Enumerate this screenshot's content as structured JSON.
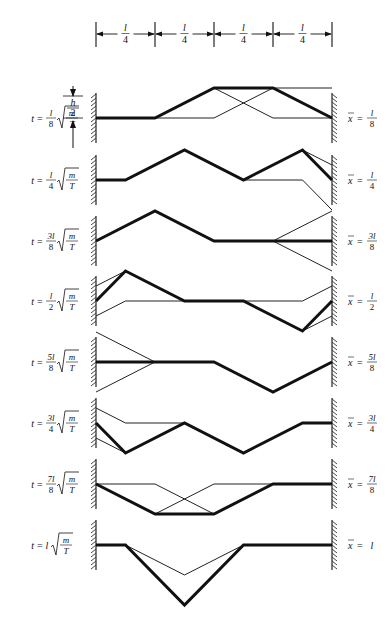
{
  "diagram": {
    "ruler": {
      "segments": [
        "l/4",
        "l/4",
        "l/4",
        "l/4"
      ],
      "numerator": "l",
      "denominator": "4",
      "ticks_x": [
        96,
        155,
        214,
        273,
        332
      ]
    },
    "amplitude_label": {
      "numerator": "h",
      "denominator": "2"
    },
    "string": {
      "left_x": 96,
      "right_x": 332,
      "amplitude_px": 30
    },
    "rows": [
      {
        "id": "t1",
        "time": {
          "prefix": "t =",
          "coef_num": "l",
          "coef_den": "8",
          "rad_num": "m",
          "rad_den": "T"
        },
        "xbar": {
          "prefix": "x̄ =",
          "num": "l",
          "den": "8"
        },
        "baseline_y": 118,
        "thick": [
          [
            0,
            0
          ],
          [
            0.25,
            0
          ],
          [
            0.5,
            1
          ],
          [
            0.75,
            1
          ],
          [
            1,
            0
          ]
        ],
        "thin": [
          [
            [
              0,
              0
            ],
            [
              0.5,
              0
            ],
            [
              0.75,
              1
            ],
            [
              1,
              1
            ]
          ],
          [
            [
              0.25,
              0
            ],
            [
              0.5,
              1
            ]
          ],
          [
            [
              0.5,
              1
            ],
            [
              0.75,
              0
            ],
            [
              1,
              0
            ]
          ]
        ]
      },
      {
        "id": "t2",
        "time": {
          "prefix": "t =",
          "coef_num": "l",
          "coef_den": "4",
          "rad_num": "m",
          "rad_den": "T"
        },
        "xbar": {
          "prefix": "x̄ =",
          "num": "l",
          "den": "4"
        },
        "baseline_y": 180,
        "thick": [
          [
            0,
            0
          ],
          [
            0.125,
            0
          ],
          [
            0.375,
            1
          ],
          [
            0.625,
            0
          ],
          [
            0.875,
            1
          ],
          [
            1,
            0
          ]
        ],
        "thin": [
          [
            [
              0.625,
              0
            ],
            [
              0.875,
              0
            ],
            [
              1,
              -1
            ]
          ],
          [
            [
              0.875,
              1
            ],
            [
              1,
              0.5
            ]
          ]
        ]
      },
      {
        "id": "t3",
        "time": {
          "prefix": "t =",
          "coef_num": "3l",
          "coef_den": "8",
          "rad_num": "m",
          "rad_den": "T"
        },
        "xbar": {
          "prefix": "x̄ =",
          "num": "3l",
          "den": "8"
        },
        "baseline_y": 241,
        "thick": [
          [
            0,
            0
          ],
          [
            0.25,
            1
          ],
          [
            0.5,
            0
          ],
          [
            1,
            0
          ]
        ],
        "thin": [
          [
            [
              0.75,
              0
            ],
            [
              1,
              1
            ]
          ],
          [
            [
              0.75,
              0
            ],
            [
              1,
              -1
            ]
          ]
        ]
      },
      {
        "id": "t4",
        "time": {
          "prefix": "t =",
          "coef_num": "l",
          "coef_den": "2",
          "rad_num": "m",
          "rad_den": "T"
        },
        "xbar": {
          "prefix": "x̄ =",
          "num": "l",
          "den": "2"
        },
        "baseline_y": 301,
        "thick": [
          [
            0,
            0
          ],
          [
            0.125,
            1
          ],
          [
            0.375,
            0
          ],
          [
            0.625,
            0
          ],
          [
            0.875,
            -1
          ],
          [
            1,
            0
          ]
        ],
        "thin": [
          [
            [
              0,
              0.5
            ],
            [
              0.125,
              1
            ]
          ],
          [
            [
              0,
              -0.5
            ],
            [
              0.125,
              0
            ],
            [
              0.875,
              0
            ],
            [
              1,
              0.5
            ]
          ],
          [
            [
              0.875,
              -1
            ],
            [
              1,
              -0.5
            ]
          ]
        ]
      },
      {
        "id": "t5",
        "time": {
          "prefix": "t =",
          "coef_num": "5l",
          "coef_den": "8",
          "rad_num": "m",
          "rad_den": "T"
        },
        "xbar": {
          "prefix": "x̄ =",
          "num": "5l",
          "den": "8"
        },
        "baseline_y": 362,
        "thick": [
          [
            0,
            0
          ],
          [
            0.5,
            0
          ],
          [
            0.75,
            -1
          ],
          [
            1,
            0
          ]
        ],
        "thin": [
          [
            [
              0,
              1
            ],
            [
              0.25,
              0
            ]
          ],
          [
            [
              0,
              -1
            ],
            [
              0.25,
              0
            ]
          ]
        ]
      },
      {
        "id": "t6",
        "time": {
          "prefix": "t =",
          "coef_num": "3l",
          "coef_den": "4",
          "rad_num": "m",
          "rad_den": "T"
        },
        "xbar": {
          "prefix": "x̄ =",
          "num": "3l",
          "den": "4"
        },
        "baseline_y": 423,
        "thick": [
          [
            0,
            0
          ],
          [
            0.125,
            -1
          ],
          [
            0.375,
            0
          ],
          [
            0.625,
            -1
          ],
          [
            0.875,
            0
          ],
          [
            1,
            0
          ]
        ],
        "thin": [
          [
            [
              0,
              0.5
            ],
            [
              0.125,
              0
            ],
            [
              0.375,
              0
            ]
          ],
          [
            [
              0,
              -0.5
            ],
            [
              0.125,
              -1
            ]
          ]
        ]
      },
      {
        "id": "t7",
        "time": {
          "prefix": "t =",
          "coef_num": "7l",
          "coef_den": "8",
          "rad_num": "m",
          "rad_den": "T"
        },
        "xbar": {
          "prefix": "x̄ =",
          "num": "7l",
          "den": "8"
        },
        "baseline_y": 484,
        "thick": [
          [
            0,
            0
          ],
          [
            0.25,
            -1
          ],
          [
            0.5,
            -1
          ],
          [
            0.75,
            0
          ],
          [
            1,
            0
          ]
        ],
        "thin": [
          [
            [
              0,
              0
            ],
            [
              0.25,
              0
            ],
            [
              0.5,
              -1
            ]
          ],
          [
            [
              0.25,
              -1
            ],
            [
              0.5,
              0
            ],
            [
              0.75,
              0
            ]
          ]
        ]
      },
      {
        "id": "t8",
        "time": {
          "prefix": "t =",
          "coef_num": "l",
          "coef_den": "",
          "rad_num": "m",
          "rad_den": "T"
        },
        "xbar": {
          "prefix": "x̄ =",
          "num": "l",
          "den": ""
        },
        "baseline_y": 545,
        "thick": [
          [
            0,
            0
          ],
          [
            0.125,
            0
          ],
          [
            0.375,
            -2
          ],
          [
            0.625,
            0
          ],
          [
            1,
            0
          ]
        ],
        "thin": [
          [
            [
              0.125,
              0
            ],
            [
              0.375,
              -1
            ],
            [
              0.625,
              0
            ]
          ]
        ]
      }
    ]
  }
}
